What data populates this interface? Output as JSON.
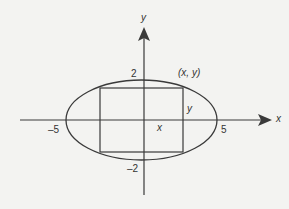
{
  "diagram": {
    "colors": {
      "stroke": "#3a3a3a",
      "text": "#333333",
      "background": "#f3f3f1"
    },
    "axes": {
      "x_label": "x",
      "y_label": "y",
      "x_ticks": [
        {
          "value": -5,
          "label": "–5"
        },
        {
          "value": 5,
          "label": "5"
        }
      ],
      "y_ticks": [
        {
          "value": 2,
          "label": "2"
        },
        {
          "value": -2,
          "label": "–2"
        }
      ]
    },
    "ellipse": {
      "semi_major": 5,
      "semi_minor": 2,
      "center": [
        0,
        0
      ]
    },
    "rectangle": {
      "corner_label": "(x, y)",
      "half_width_label": "x",
      "half_height_label": "y"
    }
  }
}
